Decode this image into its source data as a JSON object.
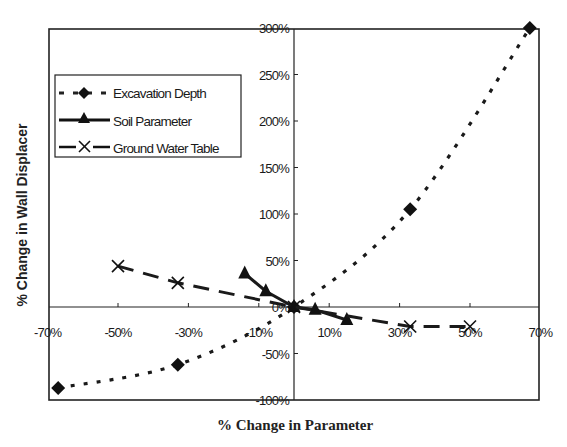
{
  "chart_data": {
    "type": "line",
    "title": "",
    "xlabel": "% Change in Parameter",
    "ylabel": "% Change in Wall Displacer",
    "xlim": [
      -70,
      70
    ],
    "ylim": [
      -100,
      300
    ],
    "x_ticks": [
      "-70%",
      "-50%",
      "-30%",
      "-10%",
      "10%",
      "30%",
      "50%",
      "70%"
    ],
    "y_ticks": [
      "300%",
      "250%",
      "200%",
      "150%",
      "100%",
      "50%",
      "0%",
      "-50%",
      "-100%"
    ],
    "grid": false,
    "legend_position": "upper-left",
    "series": [
      {
        "name": "Excavation Depth",
        "line_style": "dotted",
        "marker": "diamond",
        "x": [
          -67,
          -33,
          0,
          33,
          67
        ],
        "y": [
          -87,
          -62,
          0,
          105,
          300
        ]
      },
      {
        "name": "Soil Parameter",
        "line_style": "solid",
        "marker": "triangle",
        "x": [
          -14,
          -8,
          0,
          6,
          15
        ],
        "y": [
          36,
          17,
          0,
          -3,
          -14
        ]
      },
      {
        "name": "Ground Water Table",
        "line_style": "dashed",
        "marker": "x",
        "x": [
          -50,
          -33,
          0,
          33,
          50
        ],
        "y": [
          44,
          26,
          0,
          -21,
          -21
        ]
      }
    ]
  },
  "legend": {
    "items": [
      {
        "label": "Excavation Depth"
      },
      {
        "label": "Soil Parameter"
      },
      {
        "label": "Ground Water Table"
      }
    ]
  },
  "axes": {
    "x_title": "% Change in Parameter",
    "y_title": "% Change in Wall Displacer"
  }
}
